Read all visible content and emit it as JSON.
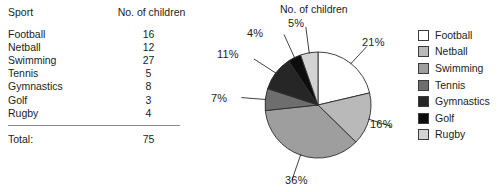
{
  "table": {
    "headers": [
      "Sport",
      "No. of children"
    ],
    "rows": [
      {
        "sport": "Football",
        "count": "16"
      },
      {
        "sport": "Netball",
        "count": "12"
      },
      {
        "sport": "Swimming",
        "count": "27"
      },
      {
        "sport": "Tennis",
        "count": "5"
      },
      {
        "sport": "Gymnastics",
        "count": "8"
      },
      {
        "sport": "Golf",
        "count": "3"
      },
      {
        "sport": "Rugby",
        "count": "4"
      }
    ],
    "total_label": "Total:",
    "total_value": "75"
  },
  "chart_data": {
    "type": "pie",
    "title": "No. of children",
    "xlabel": "",
    "ylabel": "",
    "legend_position": "right",
    "grid": false,
    "start_angle_deg": 0,
    "direction": "clockwise",
    "categories": [
      "Football",
      "Netball",
      "Swimming",
      "Tennis",
      "Gymnastics",
      "Golf",
      "Rugby"
    ],
    "values": [
      16,
      12,
      27,
      5,
      8,
      3,
      4
    ],
    "percent_labels": [
      "21%",
      "16%",
      "36%",
      "7%",
      "11%",
      "4%",
      "5%"
    ],
    "percentages": [
      21,
      16,
      36,
      7,
      11,
      4,
      5
    ],
    "colors": [
      "#ffffff",
      "#b9b9b9",
      "#9e9e9e",
      "#6e6e6e",
      "#262626",
      "#0d0d0d",
      "#d3d3d3"
    ],
    "outline_color": "#2b2b2b",
    "total": 75
  },
  "legend": {
    "items": [
      {
        "label": "Football",
        "color": "#ffffff"
      },
      {
        "label": "Netball",
        "color": "#b9b9b9"
      },
      {
        "label": "Swimming",
        "color": "#9e9e9e"
      },
      {
        "label": "Tennis",
        "color": "#6e6e6e"
      },
      {
        "label": "Gymnastics",
        "color": "#262626"
      },
      {
        "label": "Golf",
        "color": "#0d0d0d"
      },
      {
        "label": "Rugby",
        "color": "#d3d3d3"
      }
    ]
  }
}
